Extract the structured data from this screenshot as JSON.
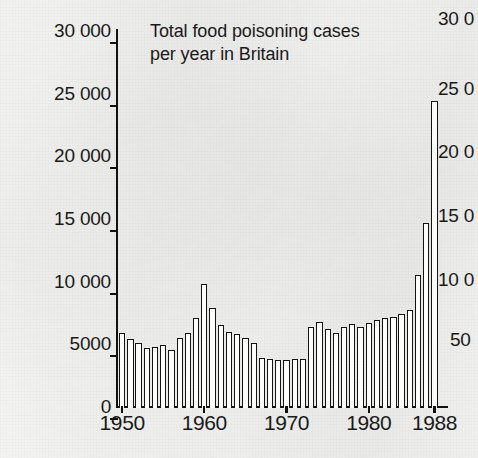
{
  "chart_data": {
    "type": "bar",
    "title": "Total food poisoning cases\nper year in Britain",
    "xlabel": "",
    "ylabel": "",
    "ylim": [
      0,
      30000
    ],
    "xlim": [
      1950,
      1988
    ],
    "grid": false,
    "legend": "none",
    "ytick_labels": [
      "0",
      "5000",
      "10 000",
      "15 000",
      "20 000",
      "25 000",
      "30 000"
    ],
    "ytick_values": [
      0,
      5000,
      10000,
      15000,
      20000,
      25000,
      30000
    ],
    "xtick_labels": [
      "1950",
      "1960",
      "1970",
      "1980",
      "1988"
    ],
    "xtick_values": [
      1950,
      1960,
      1970,
      1980,
      1988
    ],
    "categories": [
      "1950",
      "1951",
      "1952",
      "1953",
      "1954",
      "1955",
      "1956",
      "1957",
      "1958",
      "1959",
      "1960",
      "1961",
      "1962",
      "1963",
      "1964",
      "1965",
      "1966",
      "1967",
      "1968",
      "1969",
      "1970",
      "1971",
      "1972",
      "1973",
      "1974",
      "1975",
      "1976",
      "1977",
      "1978",
      "1979",
      "1980",
      "1981",
      "1982",
      "1983",
      "1984",
      "1985",
      "1986",
      "1987",
      "1988"
    ],
    "values": [
      6000,
      5500,
      5200,
      4800,
      4900,
      5000,
      4600,
      5600,
      6000,
      7200,
      9900,
      8000,
      6600,
      6100,
      5900,
      5600,
      5200,
      4000,
      3900,
      3800,
      3800,
      3900,
      3900,
      6500,
      6900,
      6300,
      6000,
      6500,
      6700,
      6500,
      6800,
      7000,
      7200,
      7300,
      7500,
      7800,
      10600,
      14800,
      24500
    ]
  },
  "main_chart": {
    "title_line1": "Total food poisoning cases",
    "title_line2": "per year in Britain",
    "title": "Total food poisoning cases\nper year in Britain"
  },
  "right_chart": {
    "note": "adjacent chart clipped by the right edge of the page",
    "ytick_labels": [
      "30 0",
      "25 0",
      "20 0",
      "15 0",
      "10 0",
      "50"
    ]
  }
}
